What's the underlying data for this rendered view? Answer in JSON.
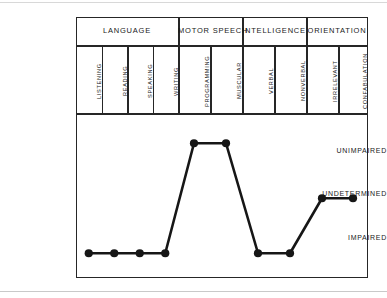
{
  "chart_data": {
    "type": "line",
    "title": "",
    "xlabel": "",
    "ylabel": "",
    "grid": false,
    "legend": null,
    "y_categories": [
      "IMPAIRED",
      "UNDETERMINED",
      "UNIMPAIRED"
    ],
    "y_tick_labels": [
      {
        "label": "UNIMPAIRED",
        "value": 2
      },
      {
        "label": "UNDETERMINED",
        "value": 1
      },
      {
        "label": "IMPAIRED",
        "value": 0
      }
    ],
    "groups": [
      {
        "label": "LANGUAGE",
        "columns": [
          "LISTENING",
          "READING",
          "SPEAKING",
          "WRITING"
        ]
      },
      {
        "label": "MOTOR SPEECH",
        "columns": [
          "PROGRAMMING",
          "MUSCULAR"
        ]
      },
      {
        "label": "INTELLIGENCE",
        "columns": [
          "VERBAL",
          "NONVERBAL"
        ]
      },
      {
        "label": "ORIENTATION",
        "columns": [
          "IRRELEVANT",
          "CONFABULATION"
        ]
      }
    ],
    "categories": [
      "LISTENING",
      "READING",
      "SPEAKING",
      "WRITING",
      "PROGRAMMING",
      "MUSCULAR",
      "VERBAL",
      "NONVERBAL",
      "IRRELEVANT",
      "CONFABULATION"
    ],
    "values": [
      0,
      0,
      0,
      0,
      2,
      2,
      0,
      0,
      1,
      1
    ],
    "value_labels": [
      "IMPAIRED",
      "IMPAIRED",
      "IMPAIRED",
      "IMPAIRED",
      "UNIMPAIRED",
      "UNIMPAIRED",
      "IMPAIRED",
      "IMPAIRED",
      "UNDETERMINED",
      "UNDETERMINED"
    ],
    "marker": "filled-circle",
    "line_color": "#161616",
    "marker_color": "#161616",
    "ylim": [
      -0.45,
      2.55
    ]
  },
  "colors": {
    "frame": "#262626",
    "ink": "#1a1a1a",
    "background": "#ffffff",
    "series": "#161616"
  }
}
